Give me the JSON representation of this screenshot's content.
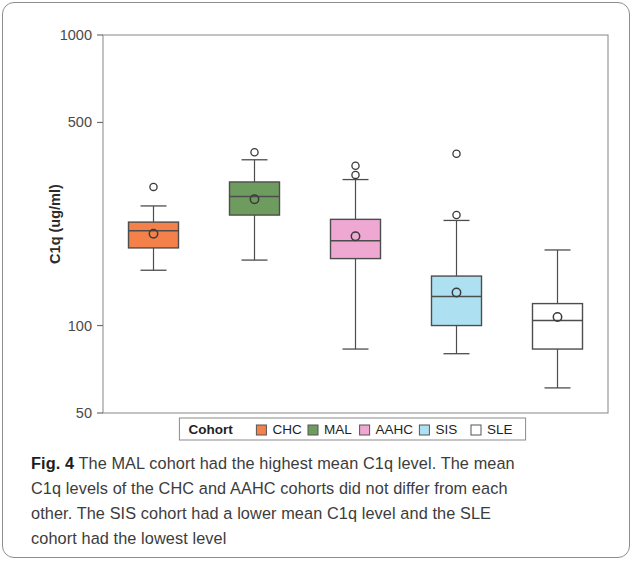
{
  "figure": {
    "label": "Fig. 4",
    "caption_lines": [
      "The MAL cohort had the highest mean C1q level. The mean",
      "C1q levels of the CHC and AAHC cohorts did not differ from each",
      "other. The SIS cohort had a lower mean C1q level and the SLE",
      "cohort had the lowest level"
    ]
  },
  "legend": {
    "title": "Cohort",
    "entries": [
      {
        "label": "CHC",
        "color": "#F4814A"
      },
      {
        "label": "MAL",
        "color": "#6E9C5E"
      },
      {
        "label": "AAHC",
        "color": "#EFA8D2"
      },
      {
        "label": "SIS",
        "color": "#ADE1F2"
      },
      {
        "label": "SLE",
        "color": "#FFFFFF"
      }
    ]
  },
  "chart_data": {
    "type": "box",
    "title": "",
    "xlabel": "",
    "ylabel": "C1q (ug/ml)",
    "yscale": "log",
    "ylim": [
      50,
      1000
    ],
    "yticks": [
      1000,
      500,
      100,
      50
    ],
    "ytick_labels": [
      "1000",
      "500",
      "100",
      "50"
    ],
    "grid": false,
    "legend_position": "bottom",
    "categories": [
      "CHC",
      "MAL",
      "AAHC",
      "SIS",
      "SLE"
    ],
    "series": [
      {
        "name": "CHC",
        "color": "#F4814A",
        "whisker_low": 155,
        "q1": 185,
        "median": 212,
        "mean": 207,
        "q3": 227,
        "whisker_high": 258,
        "outliers": [
          300
        ]
      },
      {
        "name": "MAL",
        "color": "#6E9C5E",
        "whisker_low": 168,
        "q1": 240,
        "median": 278,
        "mean": 272,
        "q3": 312,
        "whisker_high": 372,
        "outliers": [
          395
        ]
      },
      {
        "name": "AAHC",
        "color": "#EFA8D2",
        "whisker_low": 83,
        "q1": 170,
        "median": 196,
        "mean": 203,
        "q3": 232,
        "whisker_high": 318,
        "outliers": [
          330,
          355
        ]
      },
      {
        "name": "SIS",
        "color": "#ADE1F2",
        "whisker_low": 80,
        "q1": 100,
        "median": 126,
        "mean": 130,
        "q3": 148,
        "whisker_high": 230,
        "outliers": [
          240,
          390
        ]
      },
      {
        "name": "SLE",
        "color": "#FFFFFF",
        "whisker_low": 61,
        "q1": 83,
        "median": 104,
        "mean": 107,
        "q3": 119,
        "whisker_high": 182,
        "outliers": []
      }
    ]
  }
}
